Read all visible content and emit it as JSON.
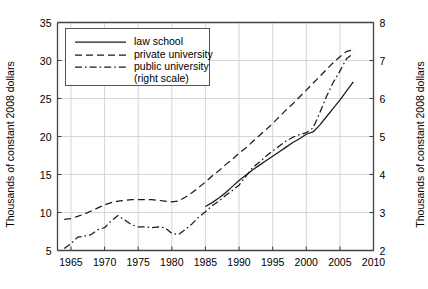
{
  "chart_data": {
    "type": "line",
    "title": "",
    "xlabel": "",
    "ylabel": "Thousands of constant 2008 dollars",
    "ylabel_right": "Thousands of constant 2008 dollars",
    "xlim": [
      1963,
      2010
    ],
    "ylim": [
      5,
      35
    ],
    "ylim_right": [
      2,
      8
    ],
    "xticks": [
      1965,
      1970,
      1975,
      1980,
      1985,
      1990,
      1995,
      2000,
      2005,
      2010
    ],
    "yticks": [
      5,
      10,
      15,
      20,
      25,
      30,
      35
    ],
    "yticks_right": [
      2,
      3,
      4,
      5,
      6,
      7,
      8
    ],
    "grid": true,
    "legend_position": "upper-left-inside",
    "series": [
      {
        "name": "law school",
        "axis": "left",
        "dash": "solid",
        "color": "#1a1a1a",
        "x": [
          1985,
          1986,
          1987,
          1988,
          1989,
          1990,
          1991,
          1992,
          1993,
          1994,
          1995,
          1996,
          1997,
          1998,
          1999,
          2000,
          2001,
          2002,
          2003,
          2004,
          2005,
          2006,
          2007
        ],
        "y": [
          10.8,
          11.3,
          11.9,
          12.6,
          13.4,
          14.2,
          14.9,
          15.6,
          16.2,
          16.8,
          17.4,
          18.0,
          18.6,
          19.2,
          19.7,
          20.3,
          20.6,
          21.5,
          22.6,
          23.7,
          24.8,
          26.0,
          27.2
        ]
      },
      {
        "name": "private university",
        "axis": "left",
        "dash": "dashed",
        "color": "#1a1a1a",
        "x": [
          1964,
          1965,
          1966,
          1967,
          1968,
          1969,
          1970,
          1971,
          1972,
          1973,
          1974,
          1975,
          1976,
          1977,
          1978,
          1979,
          1980,
          1981,
          1982,
          1983,
          1984,
          1985,
          1986,
          1987,
          1988,
          1989,
          1990,
          1991,
          1992,
          1993,
          1994,
          1995,
          1996,
          1997,
          1998,
          1999,
          2000,
          2001,
          2002,
          2003,
          2004,
          2005,
          2006,
          2007
        ],
        "y": [
          9.1,
          9.2,
          9.5,
          9.8,
          10.2,
          10.6,
          11.0,
          11.3,
          11.5,
          11.6,
          11.7,
          11.7,
          11.7,
          11.7,
          11.6,
          11.5,
          11.4,
          11.5,
          12.0,
          12.6,
          13.3,
          14.0,
          14.8,
          15.5,
          16.3,
          17.0,
          17.8,
          18.5,
          19.3,
          20.1,
          20.9,
          21.7,
          22.6,
          23.5,
          24.3,
          25.2,
          26.1,
          27.0,
          27.9,
          28.8,
          29.7,
          30.5,
          31.2,
          31.4
        ]
      },
      {
        "name": "public university (right scale)",
        "axis": "right",
        "dash": "dashdot",
        "color": "#1a1a1a",
        "x": [
          1964,
          1965,
          1966,
          1967,
          1968,
          1969,
          1970,
          1971,
          1972,
          1973,
          1974,
          1975,
          1976,
          1977,
          1978,
          1979,
          1980,
          1981,
          1982,
          1983,
          1984,
          1985,
          1986,
          1987,
          1988,
          1989,
          1990,
          1991,
          1992,
          1993,
          1994,
          1995,
          1996,
          1997,
          1998,
          1999,
          2000,
          2001,
          2002,
          2003,
          2004,
          2005,
          2006,
          2007
        ],
        "y": [
          2.05,
          2.18,
          2.35,
          2.38,
          2.42,
          2.55,
          2.6,
          2.78,
          2.92,
          2.8,
          2.68,
          2.62,
          2.62,
          2.6,
          2.62,
          2.6,
          2.45,
          2.42,
          2.55,
          2.7,
          2.88,
          3.02,
          3.18,
          3.3,
          3.45,
          3.58,
          3.72,
          3.95,
          4.18,
          4.32,
          4.48,
          4.62,
          4.75,
          4.88,
          4.98,
          5.05,
          5.1,
          5.22,
          5.62,
          6.05,
          6.42,
          6.72,
          7.05,
          7.18
        ]
      }
    ]
  },
  "legend": {
    "items": [
      {
        "label": "law school",
        "dash": "solid"
      },
      {
        "label": "private university",
        "dash": "dashed"
      },
      {
        "label": "public university",
        "label2": "(right scale)",
        "dash": "dashdot"
      }
    ]
  },
  "axes": {
    "left_title": "Thousands of constant 2008 dollars",
    "right_title": "Thousands of constant 2008 dollars"
  },
  "colors": {
    "line": "#1a1a1a",
    "axis": "#444444",
    "grid": "#cccccc",
    "background": "#ffffff"
  }
}
